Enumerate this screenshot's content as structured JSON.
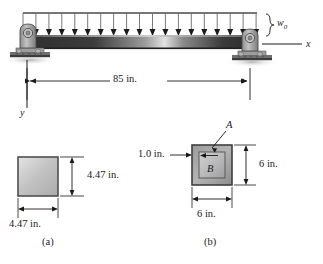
{
  "figure": {
    "caption_a": "(a)",
    "caption_b": "(b)"
  },
  "beam": {
    "load_label": "w",
    "load_subscript": "0",
    "axis_x_label": "x",
    "axis_y_label": "y",
    "span_dimension": "85 in.",
    "arrow_count": 19,
    "support_left": "pin-support",
    "support_right": "pin-support",
    "beam_color": "#3a3a3a",
    "highlight_color": "#d8d8d8"
  },
  "section_a": {
    "width_dimension": "4.47 in.",
    "height_dimension": "4.47 in.",
    "fill_color": "#c9c9c9",
    "border_color": "#555555"
  },
  "section_b": {
    "outer_width_dimension": "6 in.",
    "outer_height_dimension": "6 in.",
    "wall_thickness_dimension": "1.0 in.",
    "label_outer": "A",
    "label_inner": "B",
    "outer_fill_color": "#a8a8a8",
    "inner_fill_color": "#bdbdbd"
  }
}
